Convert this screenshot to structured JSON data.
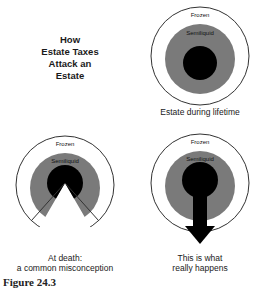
{
  "title": {
    "lines": [
      "How",
      "Estate Taxes",
      "Attack an",
      "Estate"
    ]
  },
  "colors": {
    "frozen": "#ffffff",
    "semiliquid": "#7a7a7a",
    "liquid": "#000000",
    "outline": "#333333"
  },
  "diagrams": [
    {
      "id": "lifetime",
      "outer_label": "Frozen",
      "middle_label": "Semiliquid",
      "caption_lines": [
        "Estate during lifetime"
      ]
    },
    {
      "id": "misconception",
      "outer_label": "Frozen",
      "middle_label": "Semiliquid",
      "caption_lines": [
        "At death:",
        "a common misconception"
      ]
    },
    {
      "id": "reality",
      "outer_label": "Frozen",
      "middle_label": "Semiliquid",
      "caption_lines": [
        "This is what",
        "really happens"
      ]
    }
  ],
  "figure_label": "Figure 24.3"
}
